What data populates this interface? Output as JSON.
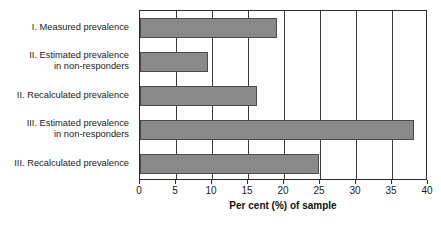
{
  "chart_data": {
    "type": "bar",
    "orientation": "horizontal",
    "title": "",
    "xlabel": "Per cent (%) of sample",
    "ylabel": "",
    "xlim": [
      0,
      40
    ],
    "xticks": [
      0,
      5,
      10,
      15,
      20,
      25,
      30,
      35,
      40
    ],
    "xticklabels": [
      "0",
      "5",
      "10",
      "15",
      "20",
      "25",
      "30",
      "35",
      "40"
    ],
    "grid": "vertical",
    "legend": "none",
    "bar_color": "#8a8a8a",
    "bar_edge_color": "#4a4a4a",
    "axis_color": "#2b2b2b",
    "categories": [
      "I. Measured prevalence",
      "II. Estimated prevalence\nin non-responders",
      "II. Recalculated prevalence",
      "III. Estimated prevalence\nin non-responders",
      "III. Recalculated prevalence"
    ],
    "values": [
      19,
      9.5,
      16.2,
      38,
      24.8
    ]
  }
}
